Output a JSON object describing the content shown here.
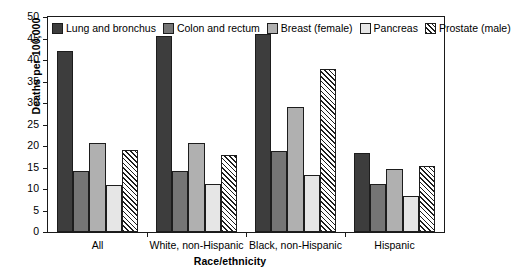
{
  "chart_data": {
    "type": "bar",
    "title": "",
    "xlabel": "Race/ethnicity",
    "ylabel": "Deaths per 100,000",
    "ylim": [
      0,
      50
    ],
    "yticks": [
      0,
      5,
      10,
      15,
      20,
      25,
      30,
      35,
      40,
      45,
      50
    ],
    "ytick_labels": [
      "0",
      "5",
      "10",
      "15",
      "20",
      "25",
      "30",
      "35",
      "40",
      "45",
      "50"
    ],
    "grid": false,
    "legend_position": "top-inside",
    "categories": [
      "All",
      "White, non-Hispanic",
      "Black, non-Hispanic",
      "Hispanic"
    ],
    "series": [
      {
        "name": "Lung and bronchus",
        "color": "#3d3d3d",
        "pattern": "solid",
        "values": [
          42.2,
          45.6,
          46.0,
          18.4
        ]
      },
      {
        "name": "Colon and rectum",
        "color": "#757575",
        "pattern": "solid",
        "values": [
          14.2,
          14.2,
          18.9,
          11.1
        ]
      },
      {
        "name": "Breast (female)",
        "color": "#b0b0b0",
        "pattern": "solid",
        "values": [
          20.7,
          20.7,
          29.0,
          14.7
        ]
      },
      {
        "name": "Pancreas",
        "color": "#e6e6e6",
        "pattern": "solid",
        "values": [
          11.0,
          11.2,
          13.3,
          8.3
        ]
      },
      {
        "name": "Prostate (male)",
        "color": "#ffffff",
        "pattern": "diagonal-hatch",
        "values": [
          19.0,
          18.0,
          38.0,
          15.4
        ]
      }
    ]
  },
  "axes": {
    "y_title": "Deaths per 100,000",
    "x_title": "Race/ethnicity"
  },
  "legend": {
    "items": [
      {
        "label": "Lung and bronchus",
        "swatch": "swatch-lung"
      },
      {
        "label": "Colon and rectum",
        "swatch": "swatch-colon"
      },
      {
        "label": "Breast (female)",
        "swatch": "swatch-breast"
      },
      {
        "label": "Pancreas",
        "swatch": "swatch-panc"
      },
      {
        "label": "Prostate (male)",
        "swatch": "swatch-prost"
      }
    ]
  }
}
